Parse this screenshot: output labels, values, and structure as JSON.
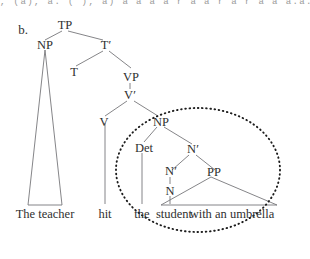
{
  "figure": {
    "label": "b.",
    "clipped_top_text": ", (a), a. ( ), a)    a a a a  r a a   r a  r a a  a.a. r",
    "sentence": "The teacher hit the student with an umbrella",
    "nodes": {
      "tp": "TP",
      "np_subject": "NP",
      "tbar": "T′",
      "t": "T",
      "vp": "VP",
      "vbar": "V′",
      "v": "V",
      "np_object": "NP",
      "det": "Det",
      "nbar_upper": "N′",
      "nbar_lower": "N′",
      "n": "N",
      "pp": "PP"
    },
    "terminals": {
      "subject": "The teacher",
      "verb": "hit",
      "det": "the",
      "noun": "student",
      "pp": "with an umbrella"
    },
    "annotation": {
      "name": "dotted-ellipse",
      "encircles": "NP object constituent"
    },
    "colors": {
      "background": "#ffffff",
      "text": "#2f2f2f",
      "branch": "#77777a",
      "ellipse": "#1d1d1d"
    }
  }
}
